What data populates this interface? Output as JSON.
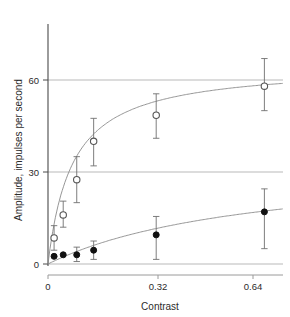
{
  "chart_data": {
    "type": "scatter",
    "title": "",
    "xlabel": "Contrast",
    "ylabel": "Amplitude, impulses per second",
    "xlim": [
      0,
      0.695
    ],
    "ylim": [
      0,
      78
    ],
    "xticks": [
      0,
      0.32,
      0.64
    ],
    "xtick_labels": [
      "0",
      "0.32",
      "0.64"
    ],
    "yticks": [
      0,
      30,
      60
    ],
    "ytick_labels": [
      "0",
      "30",
      "60"
    ],
    "grid": "horizontal gridlines at y = 0, 30, 60 spanning full plot width",
    "legend": "none",
    "series": [
      {
        "name": "open-circles",
        "marker": "open circle",
        "color": "#555555",
        "fit": "saturating hyperbolic (Naka-Rushton) curve",
        "points": [
          {
            "x": 0.018,
            "y": 8.5,
            "yerr_low": 4.5,
            "yerr_high": 12.5
          },
          {
            "x": 0.045,
            "y": 16.0,
            "yerr_low": 12.0,
            "yerr_high": 20.5
          },
          {
            "x": 0.085,
            "y": 27.5,
            "yerr_low": 20.0,
            "yerr_high": 35.0
          },
          {
            "x": 0.135,
            "y": 40.0,
            "yerr_low": 32.0,
            "yerr_high": 47.5
          },
          {
            "x": 0.32,
            "y": 48.5,
            "yerr_low": 41.0,
            "yerr_high": 55.5
          },
          {
            "x": 0.64,
            "y": 58.0,
            "yerr_low": 50.0,
            "yerr_high": 67.0
          }
        ]
      },
      {
        "name": "filled-circles",
        "marker": "filled circle",
        "color": "#111111",
        "fit": "gently rising near-linear curve",
        "points": [
          {
            "x": 0.018,
            "y": 2.5,
            "yerr_low": 2.5,
            "yerr_high": 2.5
          },
          {
            "x": 0.045,
            "y": 3.0,
            "yerr_low": 3.0,
            "yerr_high": 3.0
          },
          {
            "x": 0.085,
            "y": 3.0,
            "yerr_low": 0.8,
            "yerr_high": 5.5
          },
          {
            "x": 0.135,
            "y": 4.5,
            "yerr_low": 1.5,
            "yerr_high": 7.5
          },
          {
            "x": 0.32,
            "y": 9.5,
            "yerr_low": 1.5,
            "yerr_high": 15.5
          },
          {
            "x": 0.64,
            "y": 17.0,
            "yerr_low": 5.0,
            "yerr_high": 24.5
          }
        ]
      }
    ]
  },
  "axes": {
    "x_title": "Contrast",
    "y_title": "Amplitude, impulses per second",
    "x_tick_0": "0",
    "x_tick_1": "0.32",
    "x_tick_2": "0.64",
    "y_tick_0": "0",
    "y_tick_1": "30",
    "y_tick_2": "60"
  },
  "colors": {
    "axis": "#4a4a4a",
    "gridline": "#b8b8b8",
    "open_marker": "#555555",
    "filled_marker": "#111111",
    "curve": "#777777",
    "background": "#ffffff"
  }
}
